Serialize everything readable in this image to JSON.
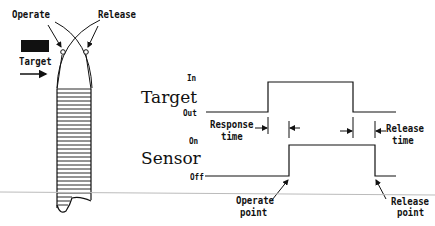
{
  "left_figure": {
    "operate_label": "Operate",
    "release_label": "Release",
    "target_label": "Target"
  },
  "timing": {
    "target_title": "Target",
    "target_high": "In",
    "target_low": "Out",
    "sensor_title": "Sensor",
    "sensor_high": "On",
    "sensor_low": "Off",
    "response_time_line1": "Response",
    "response_time_line2": "time",
    "release_time_line1": "Release",
    "release_time_line2": "time",
    "operate_point_line1": "Operate",
    "operate_point_line2": "point",
    "release_point_line1": "Release",
    "release_point_line2": "point"
  },
  "colors": {
    "ink": "#111111",
    "background": "#ffffff",
    "baseline": "#bbbbbb"
  }
}
